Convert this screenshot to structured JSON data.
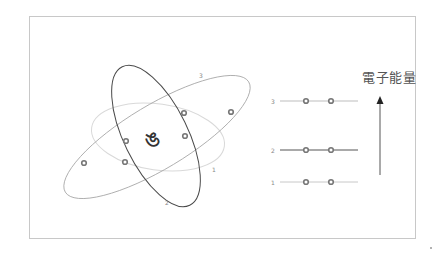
{
  "diagram": {
    "title": "電子能量",
    "nucleus_symbol": "ঙ",
    "orbits": [
      {
        "label": "1",
        "color": "#d6d6d6"
      },
      {
        "label": "2",
        "color": "#444444"
      },
      {
        "label": "3",
        "color": "#999999"
      }
    ],
    "energy_levels": [
      {
        "label": "3",
        "electrons": 2,
        "color": "#bdbdbd"
      },
      {
        "label": "2",
        "electrons": 2,
        "color": "#555555"
      },
      {
        "label": "1",
        "electrons": 2,
        "color": "#bdbdbd"
      }
    ],
    "arrow_direction": "up",
    "colors": {
      "frame": "#c8c8c8",
      "electron": "#777777",
      "text": "#555555"
    }
  }
}
